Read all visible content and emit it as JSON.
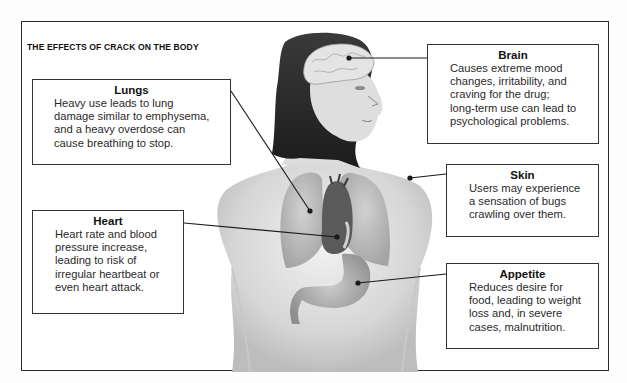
{
  "title": "THE EFFECTS OF CRACK ON THE BODY",
  "callouts": {
    "lungs": {
      "heading": "Lungs",
      "text": "Heavy use leads to lung\ndamage similar to emphysema,\nand a heavy overdose can\ncause breathing to stop."
    },
    "heart": {
      "heading": "Heart",
      "text": "Heart rate and blood\npressure increase,\nleading to risk of\nirregular heartbeat or\neven heart attack."
    },
    "brain": {
      "heading": "Brain",
      "text": "Causes extreme mood\nchanges, irritability, and\ncraving for the drug;\nlong-term use can lead to\npsychological problems."
    },
    "skin": {
      "heading": "Skin",
      "text": "Users may experience\na sensation of bugs\ncrawling over them."
    },
    "appetite": {
      "heading": "Appetite",
      "text": "Reduces desire for\nfood, leading to weight\nloss and, in severe\ncases, malnutrition."
    }
  },
  "figure": {
    "organs_shown": [
      "brain",
      "lungs",
      "heart",
      "stomach"
    ]
  }
}
